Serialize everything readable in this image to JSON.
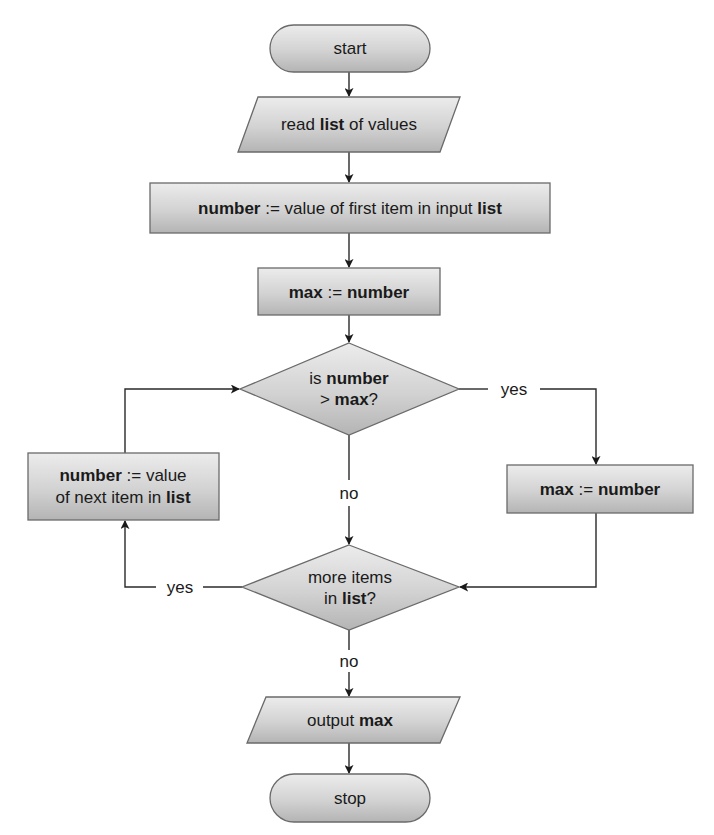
{
  "colors": {
    "shape_fill_light": "#e6e6e6",
    "shape_fill_dark": "#b9b9b9",
    "shape_stroke": "#6a6a6a",
    "edge": "#2a2a2a",
    "text": "#1a1a1a"
  },
  "nodes": {
    "start": {
      "type": "terminator",
      "label": "start"
    },
    "read": {
      "type": "io",
      "parts": [
        {
          "t": "read ",
          "bold": false
        },
        {
          "t": "list",
          "bold": true
        },
        {
          "t": " of values",
          "bold": false
        }
      ]
    },
    "init_number": {
      "type": "process",
      "parts": [
        {
          "t": "number",
          "bold": true
        },
        {
          "t": " := value of first item in input ",
          "bold": false
        },
        {
          "t": "list",
          "bold": true
        }
      ]
    },
    "init_max": {
      "type": "process",
      "parts": [
        {
          "t": "max",
          "bold": true
        },
        {
          "t": " := ",
          "bold": false
        },
        {
          "t": "number",
          "bold": true
        }
      ]
    },
    "compare": {
      "type": "decision",
      "line1": [
        {
          "t": "is ",
          "bold": false
        },
        {
          "t": "number",
          "bold": true
        }
      ],
      "line2": [
        {
          "t": "> ",
          "bold": false
        },
        {
          "t": "max",
          "bold": true
        },
        {
          "t": "?",
          "bold": false
        }
      ]
    },
    "update_max": {
      "type": "process",
      "parts": [
        {
          "t": "max",
          "bold": true
        },
        {
          "t": " := ",
          "bold": false
        },
        {
          "t": "number",
          "bold": true
        }
      ]
    },
    "next_item": {
      "type": "process",
      "line1": [
        {
          "t": "number",
          "bold": true
        },
        {
          "t": " := value",
          "bold": false
        }
      ],
      "line2": [
        {
          "t": "of next item in ",
          "bold": false
        },
        {
          "t": "list",
          "bold": true
        }
      ]
    },
    "more_items": {
      "type": "decision",
      "line1": [
        {
          "t": "more items",
          "bold": false
        }
      ],
      "line2": [
        {
          "t": "in ",
          "bold": false
        },
        {
          "t": "list",
          "bold": true
        },
        {
          "t": "?",
          "bold": false
        }
      ]
    },
    "output": {
      "type": "io",
      "parts": [
        {
          "t": "output ",
          "bold": false
        },
        {
          "t": "max",
          "bold": true
        }
      ]
    },
    "stop": {
      "type": "terminator",
      "label": "stop"
    }
  },
  "edge_labels": {
    "compare_yes": "yes",
    "compare_no": "no",
    "more_yes": "yes",
    "more_no": "no"
  },
  "edges": [
    {
      "from": "start",
      "to": "read"
    },
    {
      "from": "read",
      "to": "init_number"
    },
    {
      "from": "init_number",
      "to": "init_max"
    },
    {
      "from": "init_max",
      "to": "compare"
    },
    {
      "from": "compare",
      "to": "update_max",
      "label": "yes"
    },
    {
      "from": "compare",
      "to": "more_items",
      "label": "no"
    },
    {
      "from": "update_max",
      "to": "more_items"
    },
    {
      "from": "more_items",
      "to": "next_item",
      "label": "yes"
    },
    {
      "from": "next_item",
      "to": "compare"
    },
    {
      "from": "more_items",
      "to": "output",
      "label": "no"
    },
    {
      "from": "output",
      "to": "stop"
    }
  ]
}
